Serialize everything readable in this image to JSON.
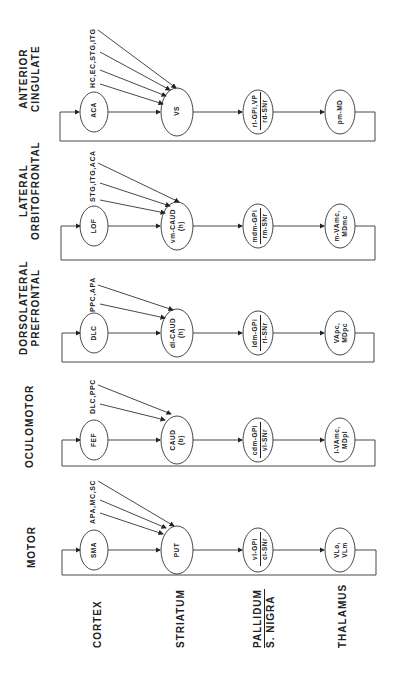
{
  "diagram": {
    "levels": [
      {
        "label": "CORTEX"
      },
      {
        "label": "STRIATUM"
      },
      {
        "label_top": "PALLIDUM",
        "label_bottom": "S. NIGRA"
      },
      {
        "label": "THALAMUS"
      }
    ],
    "circuits": [
      {
        "title_line1": "ANTERIOR",
        "title_line2": "CINGULATE",
        "inputs": "HC,EC,STG,ITG",
        "cortex": "ACA",
        "striatum": "VS",
        "pallidum_top": "rl-GPi,VP",
        "pallidum_bottom": "rd-SNr",
        "thalamus_line1": "pm-MD",
        "thalamus_line2": ""
      },
      {
        "title_line1": "LATERAL",
        "title_line2": "ORBITOFRONTAL",
        "inputs": "STG,ITG,ACA",
        "cortex": "LOF",
        "striatum_line1": "vm-CAUD",
        "striatum_line2": "(h)",
        "pallidum_top": "mdm-GPi",
        "pallidum_bottom": "rm-SNr",
        "thalamus_line1": "m-VAmc,",
        "thalamus_line2": "MDmc"
      },
      {
        "title_line1": "DORSOLATERAL",
        "title_line2": "PREFRONTAL",
        "inputs": "PPC,APA",
        "cortex": "DLC",
        "striatum_line1": "dl-CAUD",
        "striatum_line2": "(h)",
        "pallidum_top": "ldm-GPi",
        "pallidum_bottom": "rl-SNr",
        "thalamus_line1": "VApc,",
        "thalamus_line2": "MDpc"
      },
      {
        "title_line1": "OCULOMOTOR",
        "title_line2": "",
        "inputs": "DLC,PPC",
        "cortex": "FEF",
        "striatum_line1": "CAUD",
        "striatum_line2": "(b)",
        "pallidum_top": "cdm-GPi",
        "pallidum_bottom": "vl-SNr",
        "thalamus_line1": "l-VAmc,",
        "thalamus_line2": "MDpl"
      },
      {
        "title_line1": "MOTOR",
        "title_line2": "",
        "inputs": "APA,MC,SC",
        "cortex": "SMA",
        "striatum": "PUT",
        "pallidum_top": "vl-GPi",
        "pallidum_bottom": "cl-SNr",
        "thalamus_line1": "VLo,",
        "thalamus_line2": "VLm"
      }
    ]
  }
}
